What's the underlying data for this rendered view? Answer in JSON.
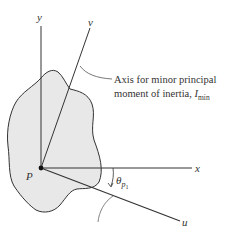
{
  "diagram": {
    "axes": {
      "x": "x",
      "y": "y",
      "u": "u",
      "v": "v"
    },
    "point_label": "P",
    "angle": {
      "symbol": "θ",
      "sub1": "p",
      "sub2": "1"
    },
    "caption": {
      "line1": "Axis for minor principal",
      "line2_prefix": "moment of inertia, ",
      "line2_symbol": "I",
      "line2_sub": "min"
    },
    "colors": {
      "region_fill": "#e8e8e8",
      "line": "#333333"
    }
  }
}
